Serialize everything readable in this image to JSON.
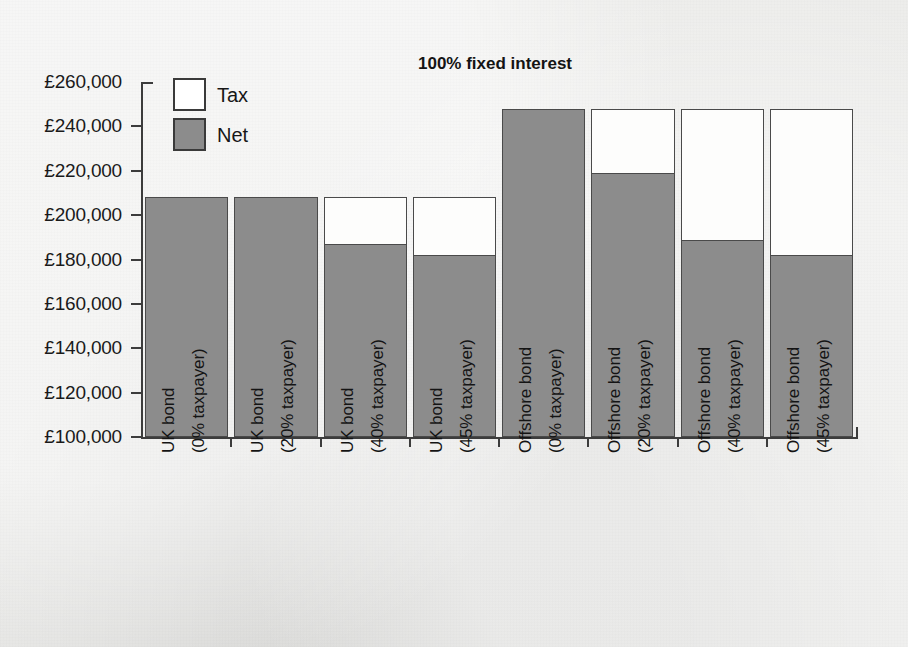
{
  "chart_data": {
    "type": "bar",
    "stacked": true,
    "title": "100% fixed interest",
    "xlabel": "",
    "ylabel": "",
    "ylim": [
      100000,
      260000
    ],
    "ytick_step": 20000,
    "ytick_labels": [
      "£260,000",
      "£240,000",
      "£220,000",
      "£200,000",
      "£180,000",
      "£160,000",
      "£140,000",
      "£120,000",
      "£100,000"
    ],
    "ytick_values": [
      260000,
      240000,
      220000,
      200000,
      180000,
      160000,
      140000,
      120000,
      100000
    ],
    "currency_symbol": "£",
    "grid": false,
    "legend_position": "top-left-inside",
    "categories": [
      "UK bond (0% taxpayer)",
      "UK bond (20% taxpayer)",
      "UK bond (40% taxpayer)",
      "UK bond (45% taxpayer)",
      "Offshore bond (0% taxpayer)",
      "Offshore bond (20% taxpayer)",
      "Offshore bond (40% taxpayer)",
      "Offshore bond (45% taxpayer)"
    ],
    "category_lines": [
      [
        "UK bond",
        "(0% taxpayer)"
      ],
      [
        "UK bond",
        "(20% taxpayer)"
      ],
      [
        "UK bond",
        "(40% taxpayer)"
      ],
      [
        "UK bond",
        "(45% taxpayer)"
      ],
      [
        "Offshore bond",
        "(0% taxpayer)"
      ],
      [
        "Offshore bond",
        "(20% taxpayer)"
      ],
      [
        "Offshore bond",
        "(40% taxpayer)"
      ],
      [
        "Offshore bond",
        "(45% taxpayer)"
      ]
    ],
    "series": [
      {
        "name": "Net",
        "color": "#8c8c8c",
        "values": [
          208000,
          208000,
          187000,
          182000,
          248000,
          219000,
          189000,
          182000
        ]
      },
      {
        "name": "Tax",
        "color": "#ffffff",
        "values": [
          0,
          0,
          21000,
          26000,
          0,
          29000,
          59000,
          66000
        ]
      }
    ],
    "totals": [
      208000,
      208000,
      208000,
      208000,
      248000,
      248000,
      248000,
      248000
    ],
    "legend": [
      {
        "label": "Tax",
        "color": "#ffffff"
      },
      {
        "label": "Net",
        "color": "#8c8c8c"
      }
    ]
  }
}
